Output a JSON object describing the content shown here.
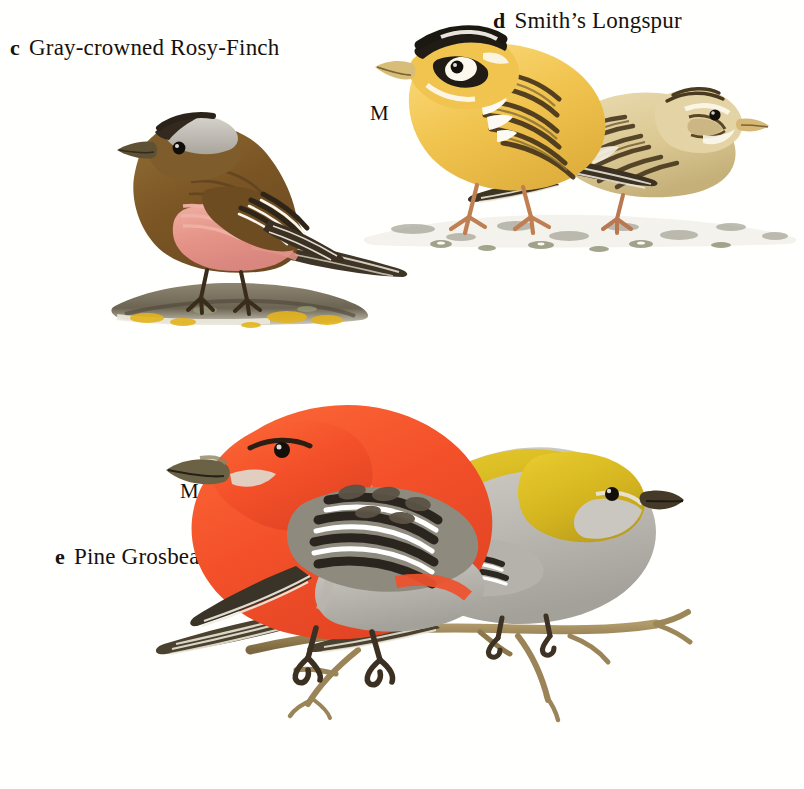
{
  "plate": {
    "background_color": "#ffffff",
    "page_width": 804,
    "page_height": 789,
    "kind": "bird-field-guide-plate"
  },
  "species": [
    {
      "key": "c",
      "name": "Gray-crowned Rosy-Finch",
      "label_text": "Gray-crowned Rosy-Finch",
      "sexes_shown": [],
      "perch": "lichen-covered rock with snow",
      "colors": {
        "body": "#7b5a2e",
        "breast_rosy": "#e8a096",
        "crown_gray": "#bfbcb6",
        "forecrown_black": "#312a22",
        "bill": "#6b5a3d",
        "lichen_yellow": "#e0b019"
      }
    },
    {
      "key": "d",
      "name": "Smith's Longspur",
      "label_text": "Smith’s Longspur",
      "sexes_shown": [
        "M",
        "F"
      ],
      "perch": "snowy gravel ground",
      "colors": {
        "male_buff": "#f2c955",
        "male_head_black": "#23201b",
        "male_head_white": "#fdfcf6",
        "female_buff": "#ddc892",
        "streaks": "#4a3a22",
        "legs": "#c07a55"
      }
    },
    {
      "key": "e",
      "name": "Pine Grosbeak",
      "label_text": "Pine Grosbeak",
      "sexes_shown": [
        "M",
        "F"
      ],
      "perch": "bare twig branch",
      "colors": {
        "male_red": "#f4512a",
        "female_yellow": "#d4b521",
        "gray": "#b6b4ae",
        "wing_black": "#2c2620",
        "wingbar_white": "#ffffff",
        "branch": "#9a8458"
      }
    }
  ],
  "sex_labels": {
    "male": "M",
    "female": "F"
  }
}
